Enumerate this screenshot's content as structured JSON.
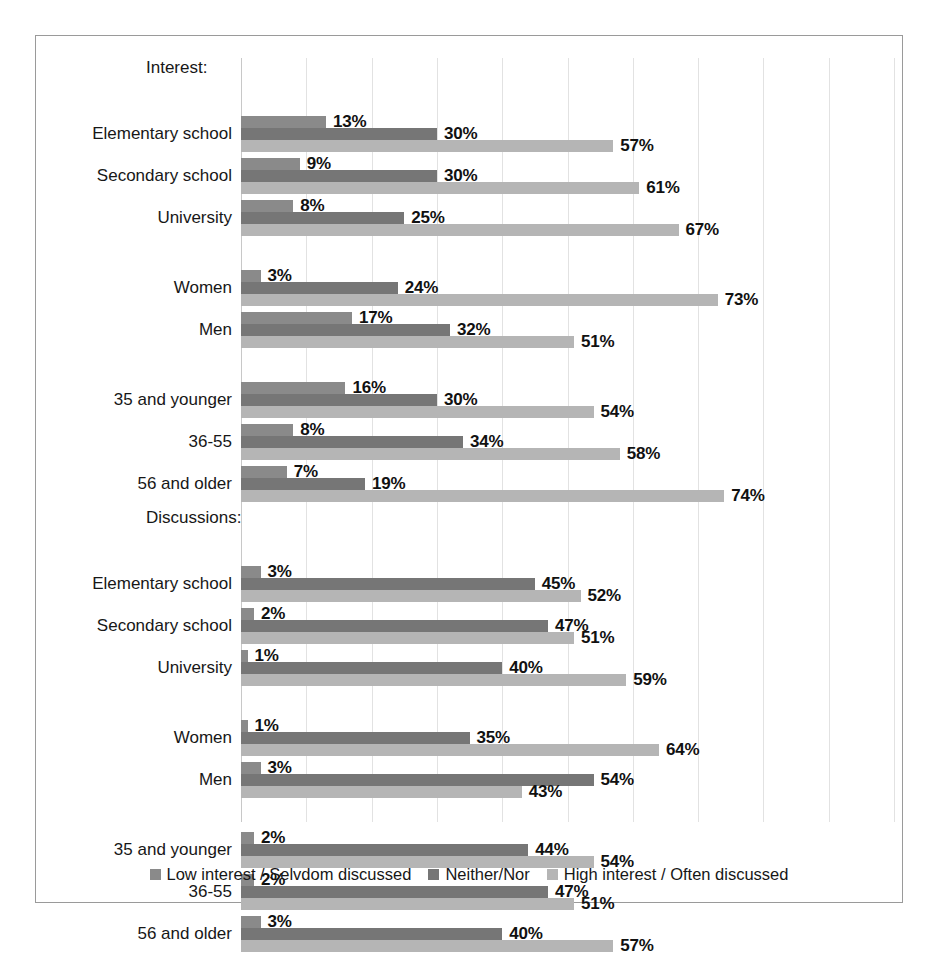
{
  "chart_data": {
    "type": "bar",
    "orientation": "horizontal",
    "title": "",
    "xlabel": "",
    "ylabel": "",
    "xlim": [
      0,
      100
    ],
    "grid": true,
    "grid_interval": 10,
    "value_suffix": "%",
    "legend_position": "bottom",
    "series": [
      {
        "name": "Low interest / Selvdom discussed",
        "color": "#8a8a8a"
      },
      {
        "name": "Neither/Nor",
        "color": "#767676"
      },
      {
        "name": "High interest / Often discussed",
        "color": "#b5b5b5"
      }
    ],
    "sections": [
      {
        "title": "Interest:",
        "groups": [
          {
            "blank_before": false,
            "rows": [
              {
                "category": "Elementary school",
                "values": [
                  13,
                  30,
                  57
                ],
                "labels": [
                  "13%",
                  "30%",
                  "57%"
                ]
              },
              {
                "category": "Secondary school",
                "values": [
                  9,
                  30,
                  61
                ],
                "labels": [
                  "9%",
                  "30%",
                  "61%"
                ]
              },
              {
                "category": "University",
                "values": [
                  8,
                  25,
                  67
                ],
                "labels": [
                  "8%",
                  "25%",
                  "67%"
                ]
              }
            ]
          },
          {
            "blank_before": true,
            "rows": [
              {
                "category": "Women",
                "values": [
                  3,
                  24,
                  73
                ],
                "labels": [
                  "3%",
                  "24%",
                  "73%"
                ]
              },
              {
                "category": "Men",
                "values": [
                  17,
                  32,
                  51
                ],
                "labels": [
                  "17%",
                  "32%",
                  "51%"
                ]
              }
            ]
          },
          {
            "blank_before": true,
            "rows": [
              {
                "category": "35 and younger",
                "values": [
                  16,
                  30,
                  54
                ],
                "labels": [
                  "16%",
                  "30%",
                  "54%"
                ]
              },
              {
                "category": "36-55",
                "values": [
                  8,
                  34,
                  58
                ],
                "labels": [
                  "8%",
                  "34%",
                  "58%"
                ]
              },
              {
                "category": "56 and older",
                "values": [
                  7,
                  19,
                  74
                ],
                "labels": [
                  "7%",
                  "19%",
                  "74%"
                ]
              }
            ]
          }
        ]
      },
      {
        "title": "Discussions:",
        "groups": [
          {
            "blank_before": false,
            "rows": [
              {
                "category": "Elementary school",
                "values": [
                  3,
                  45,
                  52
                ],
                "labels": [
                  "3%",
                  "45%",
                  "52%"
                ]
              },
              {
                "category": "Secondary school",
                "values": [
                  2,
                  47,
                  51
                ],
                "labels": [
                  "2%",
                  "47%",
                  "51%"
                ]
              },
              {
                "category": "University",
                "values": [
                  1,
                  40,
                  59
                ],
                "labels": [
                  "1%",
                  "40%",
                  "59%"
                ]
              }
            ]
          },
          {
            "blank_before": true,
            "rows": [
              {
                "category": "Women",
                "values": [
                  1,
                  35,
                  64
                ],
                "labels": [
                  "1%",
                  "35%",
                  "64%"
                ]
              },
              {
                "category": "Men",
                "values": [
                  3,
                  54,
                  43
                ],
                "labels": [
                  "3%",
                  "54%",
                  "43%"
                ]
              }
            ]
          },
          {
            "blank_before": true,
            "rows": [
              {
                "category": "35 and younger",
                "values": [
                  2,
                  44,
                  54
                ],
                "labels": [
                  "2%",
                  "44%",
                  "54%"
                ]
              },
              {
                "category": "36-55",
                "values": [
                  2,
                  47,
                  51
                ],
                "labels": [
                  "2%",
                  "47%",
                  "51%"
                ]
              },
              {
                "category": "56 and older",
                "values": [
                  3,
                  40,
                  57
                ],
                "labels": [
                  "3%",
                  "40%",
                  "57%"
                ]
              }
            ]
          }
        ]
      }
    ]
  },
  "legend": {
    "items": [
      {
        "label": "Low interest / Selvdom discussed",
        "color": "#8a8a8a"
      },
      {
        "label": "Neither/Nor",
        "color": "#767676"
      },
      {
        "label": "High interest / Often discussed",
        "color": "#b5b5b5"
      }
    ]
  },
  "colors": {
    "series_low": "#8a8a8a",
    "series_neither": "#767676",
    "series_high": "#b5b5b5",
    "gridline": "#e2e2e2",
    "border": "#9a9a9a",
    "background": "#ffffff"
  }
}
